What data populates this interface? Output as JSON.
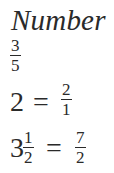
{
  "heading": "Number",
  "standalone_fraction": {
    "numerator": "3",
    "denominator": "5"
  },
  "equations": [
    {
      "lhs": {
        "whole": "2"
      },
      "operator": "=",
      "rhs": {
        "numerator": "2",
        "denominator": "1"
      }
    },
    {
      "lhs": {
        "whole": "3",
        "numerator": "1",
        "denominator": "2"
      },
      "operator": "=",
      "rhs": {
        "numerator": "7",
        "denominator": "2"
      }
    }
  ],
  "colors": {
    "text": "#2a2a2a",
    "background": "#ffffff"
  }
}
